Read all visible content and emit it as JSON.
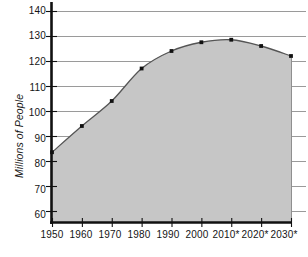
{
  "chart_data": {
    "type": "area",
    "title": "",
    "subtitle": "",
    "xlabel": "",
    "ylabel": "Millions of People",
    "categories": [
      "1950",
      "1960",
      "1970",
      "1980",
      "1990",
      "2000",
      "2010*",
      "2020*",
      "2030*"
    ],
    "x": [
      1950,
      1960,
      1970,
      1980,
      1990,
      2000,
      2010,
      2020,
      2030
    ],
    "values": [
      83.5,
      94,
      104,
      117,
      124,
      127.5,
      128.5,
      126,
      122
    ],
    "series": [
      {
        "name": "Population",
        "values": [
          83.5,
          94,
          104,
          117,
          124,
          127.5,
          128.5,
          126,
          122
        ]
      }
    ],
    "ylim": [
      55,
      140
    ],
    "xlim": [
      1950,
      2030
    ],
    "yticks": [
      60,
      70,
      80,
      90,
      100,
      110,
      120,
      130,
      140
    ],
    "ytick_labels": [
      "60",
      "70",
      "80",
      "90",
      "100",
      "110",
      "120",
      "130",
      "140"
    ],
    "xtick_labels": [
      "1950",
      "1960",
      "1970",
      "1980",
      "1990",
      "2000",
      "2010*",
      "2020*",
      "2030*"
    ],
    "grid": true,
    "grid_axis": "y",
    "legend": false,
    "legend_position": "none",
    "annotations": [
      "* denotes projected values"
    ],
    "marker": "square",
    "colors": {
      "area_fill": "#c6c6c6",
      "line": "#555555",
      "marker": "#111111",
      "grid": "#9a9a9a",
      "axis": "#111111",
      "text": "#141414",
      "background": "#ffffff"
    }
  }
}
